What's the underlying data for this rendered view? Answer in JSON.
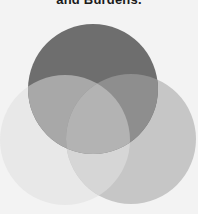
{
  "caption": {
    "text": "and Burdens."
  },
  "diagram": {
    "type": "venn",
    "circle_count": 3,
    "circles": [
      {
        "id": "top",
        "label": "",
        "cx": 93,
        "cy": 89,
        "r": 65,
        "color": "#6e6e6e"
      },
      {
        "id": "bottom-left",
        "label": "",
        "cx": 65,
        "cy": 140,
        "r": 65,
        "color": "#e8e8e8"
      },
      {
        "id": "bottom-right",
        "label": "",
        "cx": 131,
        "cy": 139,
        "r": 65,
        "color": "#c6c6c6"
      }
    ],
    "overlaps": {
      "top_bottom_left": "#a9a9a9",
      "top_bottom_right": "#8c8c8c",
      "bottom_left_bottom_right": "#d4d4d4",
      "center": "#b0b0b0"
    },
    "background": "#f3f3f3"
  }
}
